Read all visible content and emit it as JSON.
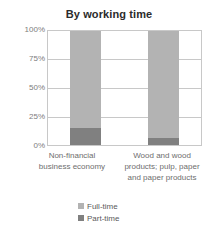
{
  "chart_data": {
    "type": "bar",
    "title": "By working time",
    "subtitle": "",
    "xlabel": "",
    "ylabel": "",
    "stacked": true,
    "stack_total_percent": 100,
    "grid": true,
    "legend_position": "bottom",
    "ylim": [
      0,
      100
    ],
    "ytick_labels": [
      "100%",
      "75%",
      "50%",
      "25%",
      "0%"
    ],
    "ytick_values": [
      100,
      75,
      50,
      25,
      0
    ],
    "categories": [
      "Non-financial business economy",
      "Wood and wood products; pulp, paper and paper products"
    ],
    "category_lines": [
      [
        "Non-financial",
        "business economy"
      ],
      [
        "Wood and wood",
        "products; pulp, paper",
        "and paper products"
      ]
    ],
    "series": [
      {
        "name": "Full-time",
        "values": [
          85,
          94
        ],
        "color": "#b3b3b3"
      },
      {
        "name": "Part-time",
        "values": [
          15,
          6
        ],
        "color": "#808080"
      }
    ]
  },
  "legend": {
    "items": [
      {
        "label": "Full-time",
        "color": "#b3b3b3"
      },
      {
        "label": "Part-time",
        "color": "#808080"
      }
    ]
  },
  "colors": {
    "full_time": "#b3b3b3",
    "part_time": "#808080",
    "grid": "#c8c8c8",
    "axis_text": "#7d7d7d",
    "title_text": "#2b2b2b",
    "background": "#ffffff"
  }
}
